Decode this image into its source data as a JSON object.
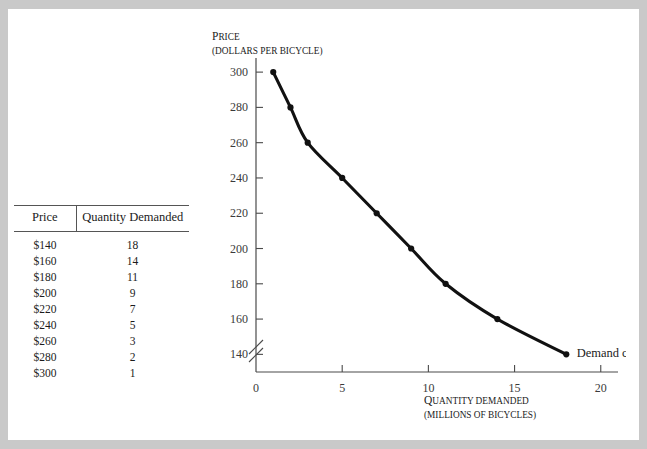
{
  "figure": {
    "table": {
      "name": "demand-schedule",
      "columns": [
        "Price",
        "Quantity Demanded"
      ],
      "rows": [
        {
          "price": "$140",
          "quantity": "18"
        },
        {
          "price": "$160",
          "quantity": "14"
        },
        {
          "price": "$180",
          "quantity": "11"
        },
        {
          "price": "$200",
          "quantity": "9"
        },
        {
          "price": "$220",
          "quantity": "7"
        },
        {
          "price": "$240",
          "quantity": "5"
        },
        {
          "price": "$260",
          "quantity": "3"
        },
        {
          "price": "$280",
          "quantity": "2"
        },
        {
          "price": "$300",
          "quantity": "1"
        }
      ]
    },
    "axis_labels": {
      "y_line1_lead": "P",
      "y_line1_rest": "RICE",
      "y_line2": "(DOLLARS PER BICYCLE)",
      "x_line1_lead": "Q",
      "x_line1_rest": "UANTITY DEMANDED",
      "x_line2": "(MILLIONS OF BICYCLES)"
    },
    "annotation": "Demand curve",
    "colors": {
      "curve": "#111111",
      "axis": "#4a4a4a",
      "frame": "#c9c9c9",
      "text": "#1b1b1b"
    }
  },
  "chart_data": {
    "type": "line",
    "title": "",
    "xlabel": "Quantity demanded (millions of bicycles)",
    "ylabel": "Price (dollars per bicycle)",
    "xlim": [
      0,
      21
    ],
    "ylim": [
      130,
      308
    ],
    "xticks": [
      0,
      5,
      10,
      15,
      20
    ],
    "yticks": [
      140,
      160,
      180,
      200,
      220,
      240,
      260,
      280,
      300
    ],
    "grid": false,
    "legend": false,
    "y_axis_break": true,
    "annotations": [
      {
        "text": "Demand curve",
        "x": 18.6,
        "y": 141
      }
    ],
    "series": [
      {
        "name": "Demand curve",
        "x": [
          1,
          2,
          3,
          5,
          7,
          9,
          11,
          14,
          18
        ],
        "y": [
          300,
          280,
          260,
          240,
          220,
          200,
          180,
          160,
          140
        ],
        "marker": "circle",
        "color": "#111111"
      }
    ]
  }
}
